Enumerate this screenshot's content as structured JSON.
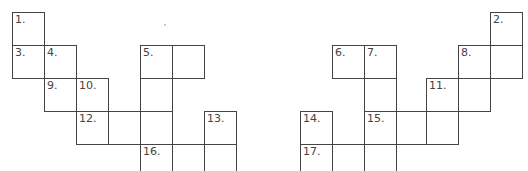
{
  "puzzle": {
    "type": "crossword-grid",
    "cell_size_px": 32,
    "cells": [
      {
        "x": 12,
        "y": 12,
        "number": "1."
      },
      {
        "x": 12,
        "y": 45,
        "number": "3."
      },
      {
        "x": 44,
        "y": 45,
        "number": "4."
      },
      {
        "x": 140,
        "y": 45,
        "number": "5."
      },
      {
        "x": 172,
        "y": 45,
        "number": ""
      },
      {
        "x": 44,
        "y": 78,
        "number": "9."
      },
      {
        "x": 76,
        "y": 78,
        "number": "10."
      },
      {
        "x": 140,
        "y": 78,
        "number": ""
      },
      {
        "x": 76,
        "y": 111,
        "number": "12."
      },
      {
        "x": 108,
        "y": 111,
        "number": ""
      },
      {
        "x": 140,
        "y": 111,
        "number": ""
      },
      {
        "x": 204,
        "y": 111,
        "number": "13."
      },
      {
        "x": 140,
        "y": 144,
        "number": "16."
      },
      {
        "x": 172,
        "y": 144,
        "number": ""
      },
      {
        "x": 204,
        "y": 144,
        "number": ""
      },
      {
        "x": 490,
        "y": 12,
        "number": "2."
      },
      {
        "x": 332,
        "y": 45,
        "number": "6."
      },
      {
        "x": 364,
        "y": 45,
        "number": "7."
      },
      {
        "x": 458,
        "y": 45,
        "number": "8."
      },
      {
        "x": 490,
        "y": 45,
        "number": ""
      },
      {
        "x": 364,
        "y": 78,
        "number": ""
      },
      {
        "x": 426,
        "y": 78,
        "number": "11."
      },
      {
        "x": 458,
        "y": 78,
        "number": ""
      },
      {
        "x": 300,
        "y": 111,
        "number": "14."
      },
      {
        "x": 364,
        "y": 111,
        "number": "15."
      },
      {
        "x": 396,
        "y": 111,
        "number": ""
      },
      {
        "x": 426,
        "y": 111,
        "number": ""
      },
      {
        "x": 300,
        "y": 144,
        "number": "17."
      },
      {
        "x": 332,
        "y": 144,
        "number": ""
      },
      {
        "x": 364,
        "y": 144,
        "number": ""
      }
    ]
  }
}
